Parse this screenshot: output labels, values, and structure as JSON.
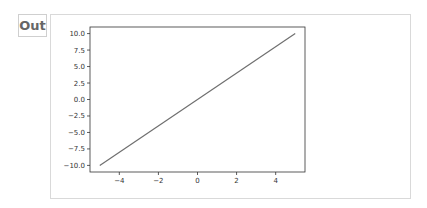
{
  "cell": {
    "prompt_label": "Out"
  },
  "chart_data": {
    "type": "line",
    "title": "",
    "xlabel": "",
    "ylabel": "",
    "xlim": [
      -5.5,
      5.5
    ],
    "ylim": [
      -11,
      11
    ],
    "grid": false,
    "legend": null,
    "x_ticks": [
      -4,
      -2,
      0,
      2,
      4
    ],
    "x_tick_labels": [
      "−4",
      "−2",
      "0",
      "2",
      "4"
    ],
    "y_ticks": [
      10.0,
      7.5,
      5.0,
      2.5,
      0.0,
      -2.5,
      -5.0,
      -7.5,
      -10.0
    ],
    "y_tick_labels": [
      "10.0",
      "7.5",
      "5.0",
      "2.5",
      "0.0",
      "−2.5",
      "−5.0",
      "−7.5",
      "−10.0"
    ],
    "series": [
      {
        "name": "y = 2x",
        "color": "#6f6f6f",
        "x": [
          -5,
          5
        ],
        "y": [
          -10,
          10
        ]
      }
    ]
  }
}
